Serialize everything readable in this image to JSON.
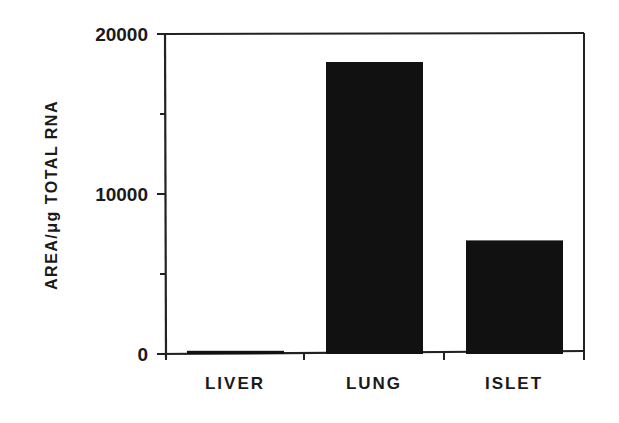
{
  "chart_data": {
    "type": "bar",
    "title": "",
    "xlabel": "",
    "ylabel": "AREA/μg  TOTAL  RNA",
    "categories": [
      "LIVER",
      "LUNG",
      "ISLET"
    ],
    "values": [
      200,
      18250,
      7100
    ],
    "ylim": [
      0,
      20000
    ],
    "yticks": [
      0,
      10000,
      20000
    ],
    "ytick_labels": [
      "0",
      "10000",
      "20000"
    ],
    "minor_yticks": [
      5000,
      15000
    ],
    "grid": false,
    "legend": null,
    "bar_color": "#111111"
  }
}
